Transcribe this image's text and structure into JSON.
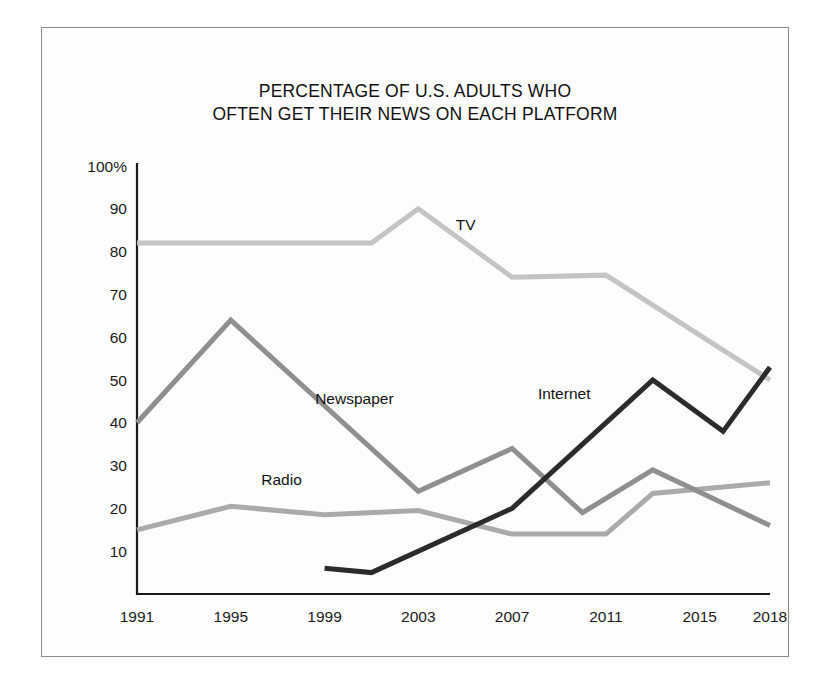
{
  "figure": {
    "title_lines": [
      "PERCENTAGE OF U.S. ADULTS WHO",
      "OFTEN GET THEIR NEWS ON EACH PLATFORM"
    ],
    "background_color": "#ffffff",
    "frame_color": "#8a8a8a"
  },
  "chart_data": {
    "type": "line",
    "title": "PERCENTAGE OF U.S. ADULTS WHO OFTEN GET THEIR NEWS ON EACH PLATFORM",
    "xlabel": "",
    "ylabel": "",
    "xlim": [
      1991,
      2018
    ],
    "ylim": [
      0,
      100
    ],
    "grid": false,
    "legend_position": "inline-labels",
    "xticks": [
      1991,
      1995,
      1999,
      2003,
      2007,
      2011,
      2015,
      2018
    ],
    "xtick_labels": [
      "1991",
      "1995",
      "1999",
      "2003",
      "2007",
      "2011",
      "2015",
      "2018"
    ],
    "yticks": [
      10,
      20,
      30,
      40,
      50,
      60,
      70,
      80,
      90,
      100
    ],
    "ytick_labels": [
      "10",
      "20",
      "30",
      "40",
      "50",
      "60",
      "70",
      "80",
      "90",
      "100%"
    ],
    "series": [
      {
        "name": "TV",
        "color": "#c4c4c4",
        "label_x": 2004.6,
        "label_y": 85,
        "x": [
          1991,
          2001,
          2003,
          2007,
          2011,
          2016,
          2018
        ],
        "values": [
          82,
          82,
          90,
          74,
          74.5,
          57,
          50
        ]
      },
      {
        "name": "Newspaper",
        "color": "#8f8f8f",
        "label_x": 1998.6,
        "label_y": 44.5,
        "x": [
          1991,
          1995,
          2003,
          2007,
          2010,
          2013,
          2018
        ],
        "values": [
          40,
          64,
          24,
          34,
          19,
          29,
          16
        ]
      },
      {
        "name": "Radio",
        "color": "#aaaaaa",
        "label_x": 1996.3,
        "label_y": 25.5,
        "x": [
          1991,
          1995,
          1999,
          2003,
          2007,
          2011,
          2013,
          2016,
          2018
        ],
        "values": [
          15,
          20.5,
          18.5,
          19.5,
          14,
          14,
          23.5,
          25,
          26
        ]
      },
      {
        "name": "Internet",
        "color": "#2b2b2b",
        "label_x": 2008.1,
        "label_y": 45.5,
        "x": [
          1999,
          2001,
          2007,
          2011,
          2013,
          2016,
          2018
        ],
        "values": [
          6,
          5,
          20,
          40,
          50,
          38,
          53
        ]
      }
    ]
  }
}
